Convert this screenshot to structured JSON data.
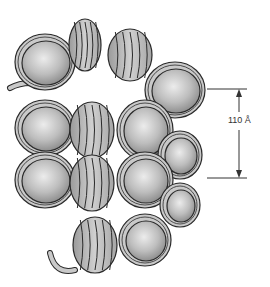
{
  "diagram": {
    "colors": {
      "core": "#b8b8b8",
      "core_highlight": "#e6e6e6",
      "dna": "#c9c9c9",
      "outline": "#2a2a2a",
      "dimension_line": "#333333"
    },
    "dimension": {
      "label": "110 Å",
      "top_y": 89,
      "bottom_y": 178
    },
    "nucleosomes": [
      {
        "cx": 45,
        "cy": 62,
        "rx": 30,
        "ry": 28,
        "view": "face"
      },
      {
        "cx": 85,
        "cy": 45,
        "rx": 16,
        "ry": 26,
        "view": "side"
      },
      {
        "cx": 130,
        "cy": 55,
        "rx": 22,
        "ry": 26,
        "view": "side"
      },
      {
        "cx": 175,
        "cy": 90,
        "rx": 30,
        "ry": 28,
        "view": "face"
      },
      {
        "cx": 45,
        "cy": 128,
        "rx": 30,
        "ry": 28,
        "view": "face"
      },
      {
        "cx": 92,
        "cy": 130,
        "rx": 22,
        "ry": 28,
        "view": "side"
      },
      {
        "cx": 145,
        "cy": 130,
        "rx": 28,
        "ry": 30,
        "view": "face"
      },
      {
        "cx": 180,
        "cy": 155,
        "rx": 22,
        "ry": 24,
        "view": "face"
      },
      {
        "cx": 45,
        "cy": 180,
        "rx": 30,
        "ry": 28,
        "view": "face"
      },
      {
        "cx": 92,
        "cy": 183,
        "rx": 22,
        "ry": 28,
        "view": "side"
      },
      {
        "cx": 145,
        "cy": 180,
        "rx": 28,
        "ry": 28,
        "view": "face"
      },
      {
        "cx": 180,
        "cy": 205,
        "rx": 20,
        "ry": 22,
        "view": "face"
      },
      {
        "cx": 95,
        "cy": 245,
        "rx": 22,
        "ry": 28,
        "view": "side"
      },
      {
        "cx": 145,
        "cy": 240,
        "rx": 26,
        "ry": 26,
        "view": "face"
      }
    ]
  }
}
